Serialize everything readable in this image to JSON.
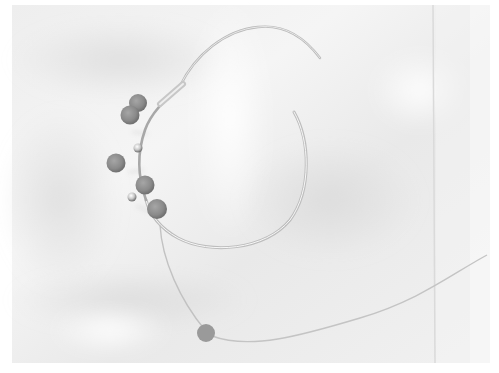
{
  "image": {
    "description": "Wire hoop bracelet with gray beads on draped white fabric, black-and-white photo",
    "colors": {
      "background_border": "#ffffff",
      "fabric_light": "#f2f2f2",
      "fabric_shadow": "#dedede",
      "wire": "#bdbdbd",
      "wire_highlight": "#f6f6f6",
      "bead": "#8f8f8f",
      "bead_dark": "#6f6f6f"
    },
    "objects": [
      {
        "name": "wire-hoop",
        "type": "open circular wire"
      },
      {
        "name": "beads",
        "count": 7
      },
      {
        "name": "trailing-wire",
        "type": "thin wire with end bead"
      },
      {
        "name": "fabric-fold",
        "type": "vertical crease at right"
      }
    ]
  }
}
